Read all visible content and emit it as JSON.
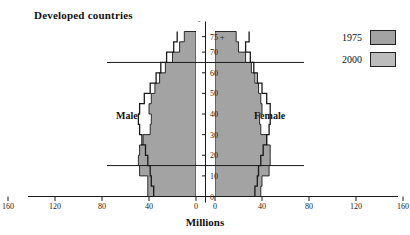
{
  "chart_title": "Developed countries",
  "age_axis_title": "Age",
  "x_axis_title": "Millions",
  "side_labels": {
    "male": "Male",
    "female": "Female"
  },
  "legend": {
    "items": [
      {
        "label": "1975",
        "color": "#a3a3a3"
      },
      {
        "label": "2000",
        "color": "#bcbcbc"
      }
    ]
  },
  "colors": {
    "fill_1975": "#a3a3a3",
    "fill_2000": "#bcbcbc",
    "outline": "#1a1a1a",
    "axis": "#1a1a1a",
    "background": "#ffffff"
  },
  "chart_data": {
    "type": "bar",
    "subtype": "population-pyramid",
    "title": "Developed countries",
    "xlabel": "Millions",
    "ylabel": "Age",
    "grid": false,
    "legend_position": "top-right",
    "xlim": [
      -180,
      180
    ],
    "x_ticks_left": [
      160,
      120,
      80,
      40,
      0
    ],
    "x_ticks_right": [
      0,
      40,
      80,
      120,
      160
    ],
    "age_ticks": [
      "0",
      "10",
      "20",
      "30",
      "40",
      "50",
      "60",
      "70",
      "75 +"
    ],
    "age_bands": [
      "0-4",
      "5-9",
      "10-14",
      "15-19",
      "20-24",
      "25-29",
      "30-34",
      "35-39",
      "40-44",
      "45-49",
      "50-54",
      "55-59",
      "60-64",
      "65-69",
      "70-74",
      "75+"
    ],
    "reference_lines": [
      {
        "label": "age 65",
        "age": 65
      },
      {
        "label": "age 15",
        "age": 15
      }
    ],
    "series": [
      {
        "name": "1975",
        "side": "Male",
        "values": [
          41,
          41,
          48,
          49,
          48,
          45,
          39,
          38,
          40,
          38,
          35,
          31,
          26,
          20,
          14,
          10
        ]
      },
      {
        "name": "1975",
        "side": "Female",
        "values": [
          39,
          40,
          46,
          47,
          47,
          44,
          39,
          38,
          40,
          39,
          37,
          34,
          31,
          26,
          20,
          18
        ]
      },
      {
        "name": "2000",
        "side": "Male",
        "values": [
          36,
          38,
          39,
          41,
          43,
          46,
          48,
          49,
          48,
          44,
          39,
          34,
          30,
          25,
          19,
          16
        ]
      },
      {
        "name": "2000",
        "side": "Female",
        "values": [
          34,
          36,
          37,
          39,
          41,
          44,
          46,
          47,
          47,
          44,
          40,
          36,
          33,
          30,
          26,
          29
        ]
      }
    ]
  }
}
